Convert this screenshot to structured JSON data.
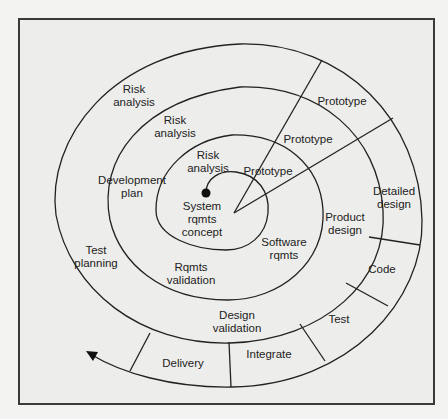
{
  "figure": {
    "type": "spiral-model-diagram",
    "colors": {
      "background": "#ededeb",
      "line": "#222222",
      "frame": "#3a3a3a",
      "text": "#222222"
    },
    "start_marker": "filled-dot",
    "end_marker": "arrowhead",
    "labels": {
      "risk_outer": "Risk\nanalysis",
      "risk_middle": "Risk\nanalysis",
      "risk_inner": "Risk\nanalysis",
      "prototype_outer": "Prototype",
      "prototype_middle": "Prototype",
      "prototype_inner": "Prototype",
      "system_concept": "System\nrqmts\nconcept",
      "development_plan": "Development\nplan",
      "test_planning": "Test\nplanning",
      "software_rqmts": "Software\nrqmts",
      "rqmts_validation": "Rqmts\nvalidation",
      "product_design": "Product\ndesign",
      "detailed_design": "Detailed\ndesign",
      "code": "Code",
      "test": "Test",
      "design_validation": "Design\nvalidation",
      "integrate": "Integrate",
      "delivery": "Delivery"
    }
  }
}
